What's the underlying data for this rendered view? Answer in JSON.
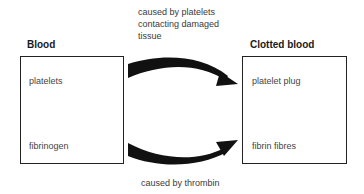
{
  "diagram": {
    "top_caption": [
      "caused by platelets",
      "contacting damaged",
      "tissue"
    ],
    "bottom_caption": "caused by thrombin",
    "left_box": {
      "title": "Blood",
      "items": [
        "platelets",
        "fibrinogen"
      ]
    },
    "right_box": {
      "title": "Clotted blood",
      "items": [
        "platelet plug",
        "fibrin fibres"
      ]
    },
    "arrows": [
      {
        "from": "platelets",
        "to": "platelet plug",
        "label": "caused by platelets contacting damaged tissue"
      },
      {
        "from": "fibrinogen",
        "to": "fibrin fibres",
        "label": "caused by thrombin"
      }
    ],
    "colors": {
      "line": "#222222",
      "text": "#333333"
    }
  }
}
